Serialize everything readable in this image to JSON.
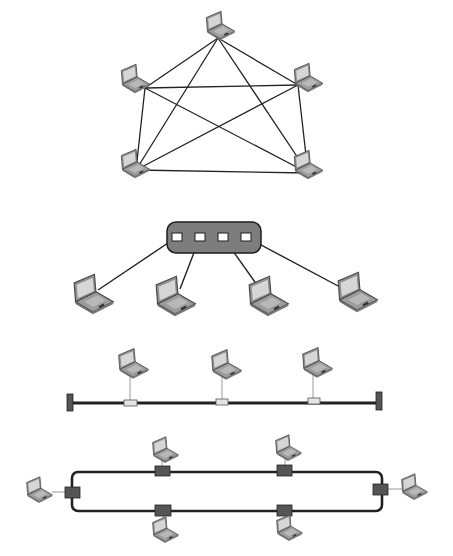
{
  "colors": {
    "background": "#ffffff",
    "link": "#222222",
    "thin_link": "#9a9a9a",
    "hub_fill": "#7d7d7d",
    "hub_stroke": "#1e1e1e",
    "port_fill": "#ffffff",
    "bus_connector_fill": "#e4e4e4",
    "ring_connector_fill": "#555555",
    "terminator_fill": "#555555",
    "laptop_body": "#9c9c9c",
    "laptop_screen": "#d6d6d6",
    "laptop_dark": "#5a5a5a"
  },
  "diagrams": {
    "mesh": {
      "label": "Mesh topology",
      "nodes": [
        {
          "id": "top",
          "x": 220,
          "y": 27,
          "cx": 218,
          "cy": 38
        },
        {
          "id": "upper-left",
          "x": 135,
          "y": 80,
          "cx": 145,
          "cy": 88
        },
        {
          "id": "upper-right",
          "x": 308,
          "y": 79,
          "cx": 298,
          "cy": 85
        },
        {
          "id": "lower-left",
          "x": 135,
          "y": 165,
          "cx": 136,
          "cy": 170
        },
        {
          "id": "lower-right",
          "x": 308,
          "y": 166,
          "cx": 308,
          "cy": 173
        }
      ],
      "links": [
        [
          0,
          1
        ],
        [
          0,
          2
        ],
        [
          0,
          3
        ],
        [
          0,
          4
        ],
        [
          1,
          2
        ],
        [
          1,
          3
        ],
        [
          1,
          4
        ],
        [
          2,
          3
        ],
        [
          2,
          4
        ],
        [
          3,
          4
        ]
      ]
    },
    "star": {
      "label": "Star topology",
      "hub": {
        "x": 167,
        "y": 222,
        "w": 94,
        "h": 31,
        "r": 9
      },
      "ports": [
        {
          "x": 172,
          "y": 233,
          "w": 10,
          "h": 8
        },
        {
          "x": 195,
          "y": 233,
          "w": 10,
          "h": 8
        },
        {
          "x": 218,
          "y": 233,
          "w": 10,
          "h": 8
        },
        {
          "x": 241,
          "y": 233,
          "w": 10,
          "h": 8
        }
      ],
      "nodes": [
        {
          "id": "hub-pc-1",
          "x": 93,
          "y": 296,
          "scale": 1.45,
          "lx": 98,
          "ly": 290
        },
        {
          "id": "hub-pc-2",
          "x": 175,
          "y": 298,
          "scale": 1.45,
          "lx": 180,
          "ly": 289
        },
        {
          "id": "hub-pc-3",
          "x": 268,
          "y": 298,
          "scale": 1.45,
          "lx": 262,
          "ly": 292
        },
        {
          "id": "hub-pc-4",
          "x": 357,
          "y": 294,
          "scale": 1.45,
          "lx": 340,
          "ly": 287
        }
      ]
    },
    "bus": {
      "label": "Bus topology",
      "line": {
        "x1": 72,
        "x2": 378,
        "y": 403
      },
      "terminators": [
        {
          "x": 67,
          "y": 394,
          "w": 6,
          "h": 17
        },
        {
          "x": 376,
          "y": 392,
          "w": 6,
          "h": 18
        }
      ],
      "connectors": [
        {
          "x": 124,
          "y": 400,
          "w": 13,
          "h": 6
        },
        {
          "x": 216,
          "y": 399,
          "w": 12,
          "h": 6
        },
        {
          "x": 308,
          "y": 398,
          "w": 12,
          "h": 6
        }
      ],
      "nodes": [
        {
          "id": "bus-pc-1",
          "x": 133,
          "y": 365,
          "dropx": 130,
          "dropy1": 376,
          "dropy2": 400
        },
        {
          "id": "bus-pc-2",
          "x": 226,
          "y": 366,
          "dropx": 222,
          "dropy1": 377,
          "dropy2": 399
        },
        {
          "id": "bus-pc-3",
          "x": 317,
          "y": 364,
          "dropx": 313,
          "dropy1": 375,
          "dropy2": 398
        }
      ]
    },
    "ring": {
      "label": "Ring topology",
      "loop": {
        "x": 72,
        "y": 472,
        "w": 310,
        "h": 39,
        "r": 6
      },
      "connectors": [
        {
          "x": 65,
          "y": 487,
          "w": 15,
          "h": 11
        },
        {
          "x": 155,
          "y": 466,
          "w": 15,
          "h": 10
        },
        {
          "x": 277,
          "y": 465,
          "w": 15,
          "h": 11
        },
        {
          "x": 373,
          "y": 484,
          "w": 15,
          "h": 11
        },
        {
          "x": 155,
          "y": 505,
          "w": 16,
          "h": 11
        },
        {
          "x": 277,
          "y": 505,
          "w": 15,
          "h": 11
        }
      ],
      "nodes": [
        {
          "id": "ring-pc-left",
          "x": 39,
          "y": 491,
          "x1": 52,
          "y1": 492,
          "x2": 65,
          "y2": 492
        },
        {
          "id": "ring-pc-top-1",
          "x": 165,
          "y": 451,
          "x1": 162,
          "y1": 460,
          "x2": 162,
          "y2": 466
        },
        {
          "id": "ring-pc-top-2",
          "x": 288,
          "y": 449,
          "x1": 285,
          "y1": 458,
          "x2": 285,
          "y2": 465
        },
        {
          "id": "ring-pc-right",
          "x": 414,
          "y": 488,
          "x1": 388,
          "y1": 489,
          "x2": 402,
          "y2": 489
        },
        {
          "id": "ring-pc-bottom-1",
          "x": 165,
          "y": 531,
          "x1": 163,
          "y1": 516,
          "x2": 163,
          "y2": 523
        },
        {
          "id": "ring-pc-bottom-2",
          "x": 289,
          "y": 529,
          "x1": 285,
          "y1": 516,
          "x2": 285,
          "y2": 521
        }
      ]
    }
  }
}
